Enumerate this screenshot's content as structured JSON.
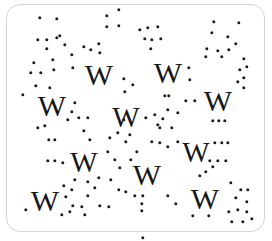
{
  "panel": {
    "kind": "captcha-letter-scatter",
    "background_color": "#ffffff",
    "border_color": "#d2d4d7",
    "ink_color": "#17171b",
    "dot_color": "#1b1b1f",
    "corner_radius_px": 14,
    "width_px": 272,
    "height_px": 241
  },
  "glyphs": {
    "character": "W",
    "count": 10,
    "items": [
      {
        "char": "W",
        "x": 99,
        "y": 75,
        "size": 30
      },
      {
        "char": "W",
        "x": 168,
        "y": 73,
        "size": 30
      },
      {
        "char": "W",
        "x": 52,
        "y": 106,
        "size": 30
      },
      {
        "char": "W",
        "x": 126,
        "y": 117,
        "size": 29
      },
      {
        "char": "W",
        "x": 218,
        "y": 101,
        "size": 30
      },
      {
        "char": "W",
        "x": 84,
        "y": 162,
        "size": 29
      },
      {
        "char": "W",
        "x": 147,
        "y": 175,
        "size": 30
      },
      {
        "char": "W",
        "x": 196,
        "y": 152,
        "size": 29
      },
      {
        "char": "W",
        "x": 45,
        "y": 201,
        "size": 30
      },
      {
        "char": "W",
        "x": 205,
        "y": 199,
        "size": 30
      }
    ]
  },
  "noise": {
    "label": "scatter-dots",
    "dot_diameter_px": 3.4,
    "count": 138,
    "points": [
      [
        40,
        18
      ],
      [
        57,
        19
      ],
      [
        107,
        16
      ],
      [
        119,
        10
      ],
      [
        107,
        27
      ],
      [
        119,
        26
      ],
      [
        38,
        40
      ],
      [
        47,
        40
      ],
      [
        57,
        38
      ],
      [
        60,
        36
      ],
      [
        140,
        30
      ],
      [
        148,
        28
      ],
      [
        158,
        27
      ],
      [
        145,
        39
      ],
      [
        152,
        40
      ],
      [
        161,
        39
      ],
      [
        214,
        22
      ],
      [
        239,
        23
      ],
      [
        47,
        49
      ],
      [
        65,
        45
      ],
      [
        84,
        47
      ],
      [
        91,
        50
      ],
      [
        99,
        44
      ],
      [
        212,
        33
      ],
      [
        228,
        37
      ],
      [
        236,
        44
      ],
      [
        72,
        55
      ],
      [
        100,
        53
      ],
      [
        151,
        49
      ],
      [
        34,
        63
      ],
      [
        53,
        60
      ],
      [
        207,
        49
      ],
      [
        218,
        51
      ],
      [
        229,
        50
      ],
      [
        41,
        73
      ],
      [
        54,
        70
      ],
      [
        73,
        68
      ],
      [
        206,
        57
      ],
      [
        222,
        57
      ],
      [
        244,
        59
      ],
      [
        247,
        67
      ],
      [
        240,
        70
      ],
      [
        124,
        79
      ],
      [
        133,
        85
      ],
      [
        189,
        68
      ],
      [
        190,
        80
      ],
      [
        244,
        78
      ],
      [
        238,
        82
      ],
      [
        31,
        73
      ],
      [
        36,
        86
      ],
      [
        50,
        88
      ],
      [
        244,
        88
      ],
      [
        23,
        95
      ],
      [
        75,
        103
      ],
      [
        72,
        112
      ],
      [
        165,
        96
      ],
      [
        169,
        96
      ],
      [
        186,
        101
      ],
      [
        195,
        101
      ],
      [
        68,
        120
      ],
      [
        79,
        118
      ],
      [
        88,
        118
      ],
      [
        125,
        92
      ],
      [
        146,
        118
      ],
      [
        155,
        115
      ],
      [
        163,
        119
      ],
      [
        160,
        128
      ],
      [
        213,
        121
      ],
      [
        219,
        121
      ],
      [
        225,
        121
      ],
      [
        49,
        140
      ],
      [
        55,
        140
      ],
      [
        110,
        138
      ],
      [
        118,
        133
      ],
      [
        126,
        142
      ],
      [
        48,
        161
      ],
      [
        55,
        161
      ],
      [
        63,
        163
      ],
      [
        108,
        152
      ],
      [
        115,
        160
      ],
      [
        120,
        168
      ],
      [
        178,
        142
      ],
      [
        168,
        147
      ],
      [
        158,
        125
      ],
      [
        172,
        128
      ],
      [
        215,
        143
      ],
      [
        222,
        143
      ],
      [
        228,
        143
      ],
      [
        210,
        161
      ],
      [
        218,
        161
      ],
      [
        226,
        161
      ],
      [
        213,
        167
      ],
      [
        124,
        120
      ],
      [
        130,
        135
      ],
      [
        75,
        180
      ],
      [
        72,
        190
      ],
      [
        64,
        186
      ],
      [
        88,
        182
      ],
      [
        99,
        178
      ],
      [
        111,
        180
      ],
      [
        119,
        190
      ],
      [
        126,
        192
      ],
      [
        135,
        196
      ],
      [
        143,
        196
      ],
      [
        142,
        204
      ],
      [
        142,
        211
      ],
      [
        100,
        206
      ],
      [
        109,
        207
      ],
      [
        66,
        197
      ],
      [
        73,
        206
      ],
      [
        82,
        207
      ],
      [
        26,
        210
      ],
      [
        62,
        215
      ],
      [
        70,
        212
      ],
      [
        85,
        215
      ],
      [
        231,
        183
      ],
      [
        241,
        190
      ],
      [
        248,
        190
      ],
      [
        236,
        198
      ],
      [
        247,
        202
      ],
      [
        229,
        212
      ],
      [
        238,
        210
      ],
      [
        247,
        212
      ],
      [
        193,
        216
      ],
      [
        209,
        216
      ],
      [
        232,
        222
      ],
      [
        243,
        222
      ],
      [
        252,
        219
      ],
      [
        143,
        238
      ],
      [
        168,
        110
      ],
      [
        178,
        113
      ],
      [
        84,
        131
      ],
      [
        90,
        140
      ],
      [
        38,
        128
      ],
      [
        45,
        126
      ],
      [
        200,
        176
      ],
      [
        206,
        172
      ],
      [
        152,
        142
      ],
      [
        160,
        143
      ],
      [
        131,
        160
      ],
      [
        137,
        152
      ],
      [
        88,
        196
      ],
      [
        95,
        188
      ],
      [
        168,
        196
      ],
      [
        176,
        204
      ]
    ]
  }
}
